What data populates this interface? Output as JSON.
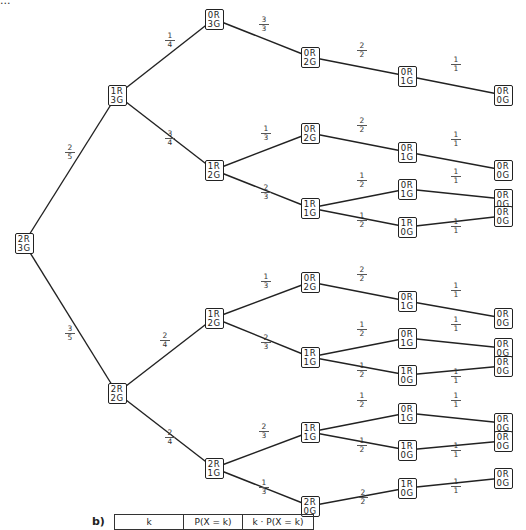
{
  "header_fragment": "...",
  "nodes": [
    {
      "id": "n0",
      "label": [
        "2R",
        "3G"
      ],
      "x": 24,
      "y": 243
    },
    {
      "id": "n1",
      "label": [
        "1R",
        "3G"
      ],
      "x": 117,
      "y": 95
    },
    {
      "id": "n2",
      "label": [
        "2R",
        "2G"
      ],
      "x": 117,
      "y": 393
    },
    {
      "id": "n3",
      "label": [
        "0R",
        "3G"
      ],
      "x": 214,
      "y": 19
    },
    {
      "id": "n4",
      "label": [
        "1R",
        "2G"
      ],
      "x": 214,
      "y": 170
    },
    {
      "id": "n5",
      "label": [
        "1R",
        "2G"
      ],
      "x": 214,
      "y": 318
    },
    {
      "id": "n6",
      "label": [
        "2R",
        "1G"
      ],
      "x": 214,
      "y": 468
    },
    {
      "id": "n7",
      "label": [
        "0R",
        "2G"
      ],
      "x": 310,
      "y": 57
    },
    {
      "id": "n8",
      "label": [
        "0R",
        "2G"
      ],
      "x": 310,
      "y": 133
    },
    {
      "id": "n9",
      "label": [
        "1R",
        "1G"
      ],
      "x": 310,
      "y": 208
    },
    {
      "id": "n10",
      "label": [
        "0R",
        "2G"
      ],
      "x": 310,
      "y": 282
    },
    {
      "id": "n11",
      "label": [
        "1R",
        "1G"
      ],
      "x": 310,
      "y": 357
    },
    {
      "id": "n12",
      "label": [
        "1R",
        "1G"
      ],
      "x": 310,
      "y": 432
    },
    {
      "id": "n13",
      "label": [
        "2R",
        "0G"
      ],
      "x": 310,
      "y": 506
    },
    {
      "id": "n14",
      "label": [
        "0R",
        "1G"
      ],
      "x": 407,
      "y": 76
    },
    {
      "id": "n15",
      "label": [
        "0R",
        "1G"
      ],
      "x": 407,
      "y": 152
    },
    {
      "id": "n16",
      "label": [
        "0R",
        "1G"
      ],
      "x": 407,
      "y": 189
    },
    {
      "id": "n17",
      "label": [
        "1R",
        "0G"
      ],
      "x": 407,
      "y": 227
    },
    {
      "id": "n18",
      "label": [
        "0R",
        "1G"
      ],
      "x": 407,
      "y": 301
    },
    {
      "id": "n19",
      "label": [
        "0R",
        "1G"
      ],
      "x": 407,
      "y": 338
    },
    {
      "id": "n20",
      "label": [
        "1R",
        "0G"
      ],
      "x": 407,
      "y": 375
    },
    {
      "id": "n21",
      "label": [
        "0R",
        "1G"
      ],
      "x": 407,
      "y": 413
    },
    {
      "id": "n22",
      "label": [
        "1R",
        "0G"
      ],
      "x": 407,
      "y": 450
    },
    {
      "id": "n23",
      "label": [
        "1R",
        "0G"
      ],
      "x": 407,
      "y": 488
    },
    {
      "id": "n24",
      "label": [
        "0R",
        "0G"
      ],
      "x": 503,
      "y": 95
    },
    {
      "id": "n25",
      "label": [
        "0R",
        "0G"
      ],
      "x": 503,
      "y": 170
    },
    {
      "id": "n26",
      "label": [
        "0R",
        "0G"
      ],
      "x": 503,
      "y": 199
    },
    {
      "id": "n27",
      "label": [
        "0R",
        "0G"
      ],
      "x": 503,
      "y": 216
    },
    {
      "id": "n28",
      "label": [
        "0R",
        "0G"
      ],
      "x": 503,
      "y": 318
    },
    {
      "id": "n29",
      "label": [
        "0R",
        "0G"
      ],
      "x": 503,
      "y": 348
    },
    {
      "id": "n30",
      "label": [
        "0R",
        "0G"
      ],
      "x": 503,
      "y": 366
    },
    {
      "id": "n31",
      "label": [
        "0R",
        "0G"
      ],
      "x": 503,
      "y": 423
    },
    {
      "id": "n32",
      "label": [
        "0R",
        "0G"
      ],
      "x": 503,
      "y": 441
    },
    {
      "id": "n33",
      "label": [
        "0R",
        "0G"
      ],
      "x": 503,
      "y": 478
    }
  ],
  "edges": [
    {
      "from": "n0",
      "to": "n1",
      "num": "2",
      "den": "5",
      "lx": 70,
      "ly": 152
    },
    {
      "from": "n0",
      "to": "n2",
      "num": "3",
      "den": "5",
      "lx": 70,
      "ly": 333
    },
    {
      "from": "n1",
      "to": "n3",
      "num": "1",
      "den": "4",
      "lx": 170,
      "ly": 40
    },
    {
      "from": "n1",
      "to": "n4",
      "num": "3",
      "den": "4",
      "lx": 170,
      "ly": 138
    },
    {
      "from": "n3",
      "to": "n7",
      "num": "3",
      "den": "3",
      "lx": 264,
      "ly": 24
    },
    {
      "from": "n4",
      "to": "n8",
      "num": "1",
      "den": "3",
      "lx": 266,
      "ly": 133
    },
    {
      "from": "n4",
      "to": "n9",
      "num": "2",
      "den": "3",
      "lx": 266,
      "ly": 192
    },
    {
      "from": "n7",
      "to": "n14",
      "num": "2",
      "den": "2",
      "lx": 362,
      "ly": 50
    },
    {
      "from": "n8",
      "to": "n15",
      "num": "2",
      "den": "2",
      "lx": 362,
      "ly": 125
    },
    {
      "from": "n9",
      "to": "n16",
      "num": "1",
      "den": "2",
      "lx": 362,
      "ly": 180
    },
    {
      "from": "n9",
      "to": "n17",
      "num": "1",
      "den": "2",
      "lx": 362,
      "ly": 220
    },
    {
      "from": "n14",
      "to": "n24",
      "num": "1",
      "den": "1",
      "lx": 456,
      "ly": 64
    },
    {
      "from": "n15",
      "to": "n25",
      "num": "1",
      "den": "1",
      "lx": 456,
      "ly": 139
    },
    {
      "from": "n16",
      "to": "n26",
      "num": "1",
      "den": "1",
      "lx": 456,
      "ly": 176
    },
    {
      "from": "n17",
      "to": "n27",
      "num": "1",
      "den": "1",
      "lx": 456,
      "ly": 226
    },
    {
      "from": "n2",
      "to": "n5",
      "num": "2",
      "den": "4",
      "lx": 165,
      "ly": 340
    },
    {
      "from": "n2",
      "to": "n6",
      "num": "2",
      "den": "4",
      "lx": 170,
      "ly": 437
    },
    {
      "from": "n5",
      "to": "n10",
      "num": "1",
      "den": "3",
      "lx": 266,
      "ly": 281
    },
    {
      "from": "n5",
      "to": "n11",
      "num": "2",
      "den": "3",
      "lx": 266,
      "ly": 342
    },
    {
      "from": "n10",
      "to": "n18",
      "num": "2",
      "den": "2",
      "lx": 362,
      "ly": 274
    },
    {
      "from": "n11",
      "to": "n19",
      "num": "1",
      "den": "2",
      "lx": 362,
      "ly": 329
    },
    {
      "from": "n11",
      "to": "n20",
      "num": "1",
      "den": "2",
      "lx": 362,
      "ly": 370
    },
    {
      "from": "n18",
      "to": "n28",
      "num": "1",
      "den": "1",
      "lx": 456,
      "ly": 290
    },
    {
      "from": "n19",
      "to": "n29",
      "num": "1",
      "den": "1",
      "lx": 456,
      "ly": 324
    },
    {
      "from": "n20",
      "to": "n30",
      "num": "1",
      "den": "1",
      "lx": 456,
      "ly": 376
    },
    {
      "from": "n6",
      "to": "n12",
      "num": "2",
      "den": "3",
      "lx": 264,
      "ly": 431
    },
    {
      "from": "n6",
      "to": "n13",
      "num": "1",
      "den": "3",
      "lx": 264,
      "ly": 487
    },
    {
      "from": "n12",
      "to": "n21",
      "num": "1",
      "den": "2",
      "lx": 362,
      "ly": 400
    },
    {
      "from": "n12",
      "to": "n22",
      "num": "1",
      "den": "2",
      "lx": 362,
      "ly": 445
    },
    {
      "from": "n13",
      "to": "n23",
      "num": "2",
      "den": "2",
      "lx": 363,
      "ly": 497
    },
    {
      "from": "n21",
      "to": "n31",
      "num": "1",
      "den": "1",
      "lx": 456,
      "ly": 400
    },
    {
      "from": "n22",
      "to": "n32",
      "num": "1",
      "den": "1",
      "lx": 456,
      "ly": 450
    },
    {
      "from": "n23",
      "to": "n33",
      "num": "1",
      "den": "1",
      "lx": 456,
      "ly": 486
    }
  ],
  "part_b": {
    "label": "b)",
    "table_headers": [
      "k",
      "P(X = k)",
      "k · P(X = k)"
    ]
  }
}
